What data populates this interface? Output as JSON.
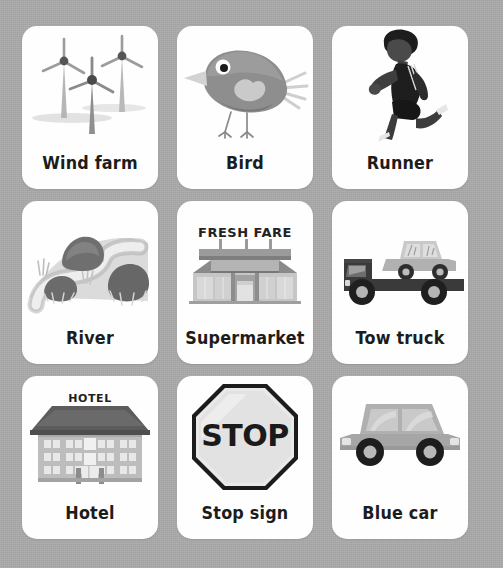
{
  "page": {
    "background_color": "#a9a9a9",
    "card_color": "#fefefe",
    "text_color": "#1c1c1c",
    "grid": {
      "rows": 3,
      "columns": 3,
      "count": 9
    }
  },
  "cards": [
    {
      "label": "Wind farm",
      "icon": "wind-turbines-icon",
      "row": 1,
      "column": 1
    },
    {
      "label": "Bird",
      "icon": "bird-icon",
      "row": 1,
      "column": 2
    },
    {
      "label": "Runner",
      "icon": "runner-icon",
      "row": 1,
      "column": 3
    },
    {
      "label": "River",
      "icon": "river-icon",
      "row": 2,
      "column": 1
    },
    {
      "label": "Supermarket",
      "icon": "supermarket-icon",
      "row": 2,
      "column": 2,
      "sign_text": "FRESH FARE"
    },
    {
      "label": "Tow truck",
      "icon": "tow-truck-icon",
      "row": 2,
      "column": 3
    },
    {
      "label": "Hotel",
      "icon": "hotel-icon",
      "row": 3,
      "column": 1,
      "sign_text": "HOTEL"
    },
    {
      "label": "Stop sign",
      "icon": "stop-sign-icon",
      "row": 3,
      "column": 2,
      "sign_text": "STOP"
    },
    {
      "label": "Blue car",
      "icon": "car-icon",
      "row": 3,
      "column": 3
    }
  ]
}
